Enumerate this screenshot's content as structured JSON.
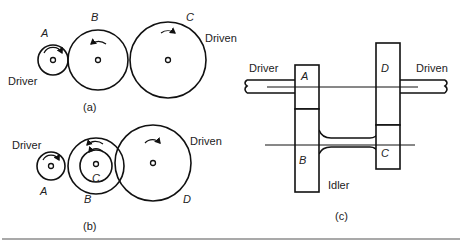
{
  "figure_a": {
    "caption": "(a)",
    "gears": [
      {
        "name": "A",
        "role": "Driver",
        "rotation": "clockwise"
      },
      {
        "name": "B",
        "role": "",
        "rotation": "counterclockwise"
      },
      {
        "name": "C",
        "role": "Driven",
        "rotation": "clockwise"
      }
    ],
    "driver_label": "Driver",
    "driven_label": "Driven"
  },
  "figure_b": {
    "caption": "(b)",
    "gears": [
      {
        "name": "A",
        "role": "Driver",
        "rotation": "clockwise"
      },
      {
        "name": "B",
        "role": "",
        "rotation": "counterclockwise"
      },
      {
        "name": "C",
        "role": "",
        "rotation": "counterclockwise"
      },
      {
        "name": "D",
        "role": "Driven",
        "rotation": "clockwise"
      }
    ],
    "driver_label": "Driver",
    "driven_label": "Driven"
  },
  "figure_c": {
    "caption": "(c)",
    "driver_label": "Driver",
    "driven_label": "Driven",
    "idler_label": "Idler",
    "gear_labels": [
      "A",
      "B",
      "C",
      "D"
    ]
  },
  "colors": {
    "line": "#111111",
    "background": "#ffffff"
  }
}
